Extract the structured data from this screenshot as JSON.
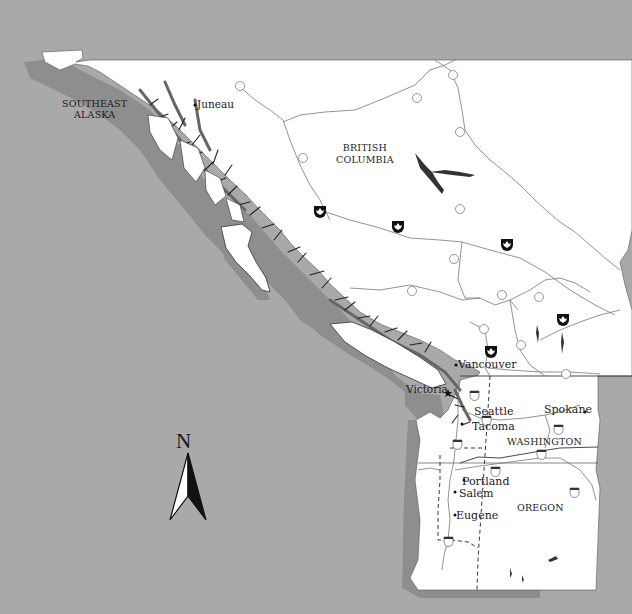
{
  "map": {
    "colors": {
      "ocean": "#a9a9a9",
      "shelf": "#8e8e8e",
      "land": "#ffffff",
      "border": "#333333",
      "text": "#1a1a1a"
    },
    "regions": {
      "southeast_alaska_line1": "SOUTHEAST",
      "southeast_alaska_line2": "ALASKA",
      "british_columbia_line1": "BRITISH",
      "british_columbia_line2": "COLUMBIA",
      "washington": "WASHINGTON",
      "oregon": "OREGON"
    },
    "cities": {
      "juneau": "Juneau",
      "vancouver": "Vancouver",
      "victoria": "Victoria",
      "seattle": "Seattle",
      "tacoma": "Tacoma",
      "spokane": "Spokane",
      "portland": "Portland",
      "salem": "Salem",
      "eugene": "Eugene"
    },
    "highway_shields": {
      "bc_37_north": "37",
      "bc_37_south": "37",
      "bc_77": "77",
      "bc_97_north": "97",
      "bc_97_mid": "97",
      "bc_97_south1": "97",
      "bc_97_south2": "97",
      "bc_20": "20",
      "bc_32": "32",
      "bc_5a": "5",
      "bc_5b": "5",
      "bc_3": "3",
      "i_5_north": "5",
      "i_5_mid": "5",
      "i_5_south": "5",
      "i_90_west": "90",
      "i_90_east": "90",
      "i_82": "82",
      "i_84_west": "84",
      "i_84_east": "84"
    },
    "park_markers_count": 6,
    "compass": {
      "label": "N"
    }
  }
}
